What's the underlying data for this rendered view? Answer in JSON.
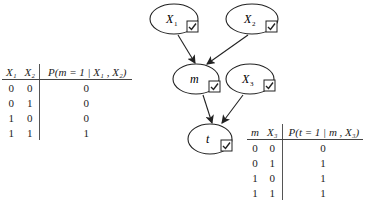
{
  "nodes": [
    {
      "id": "X1",
      "label": "X",
      "sub": "1",
      "cx": 172,
      "cy": 19
    },
    {
      "id": "X2",
      "label": "X",
      "sub": "2",
      "cx": 255,
      "cy": 19
    },
    {
      "id": "m",
      "label": "m",
      "sub": "",
      "cx": 198,
      "cy": 79
    },
    {
      "id": "X3",
      "label": "X",
      "sub": "3",
      "cx": 256,
      "cy": 79
    },
    {
      "id": "t",
      "label": "t",
      "sub": "",
      "cx": 214,
      "cy": 139
    }
  ],
  "edges": [
    {
      "from": "X1",
      "to": "m"
    },
    {
      "from": "X2",
      "to": "m"
    },
    {
      "from": "m",
      "to": "t"
    },
    {
      "from": "X3",
      "to": "t"
    }
  ],
  "table_m": {
    "headers": [
      "X₁",
      "X₂",
      "P(m = 1 | X₁ , X₂)"
    ],
    "rows": [
      [
        "0",
        "0",
        "0"
      ],
      [
        "0",
        "1",
        "0"
      ],
      [
        "1",
        "0",
        "0"
      ],
      [
        "1",
        "1",
        "1"
      ]
    ]
  },
  "table_t": {
    "headers": [
      "m",
      "X₃",
      "P(t = 1 | m , X₃)"
    ],
    "rows": [
      [
        "0",
        "0",
        "0"
      ],
      [
        "0",
        "1",
        "1"
      ],
      [
        "1",
        "0",
        "1"
      ],
      [
        "1",
        "1",
        "1"
      ]
    ]
  }
}
